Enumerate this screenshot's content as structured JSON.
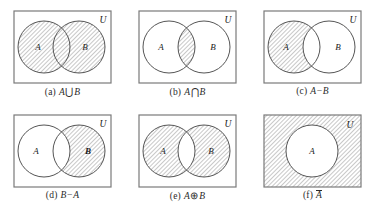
{
  "figure": {
    "universe_label": "U",
    "set_a_label": "A",
    "set_b_label": "B",
    "colors": {
      "border": "#7a7a7a",
      "circle_stroke": "#555555",
      "hatch_line": "#9a9a9a",
      "hatch_background": "#ffffff",
      "text": "#1a1a1a",
      "page_background": "#ffffff"
    },
    "panels": [
      {
        "key": "a",
        "caption_label": "(a)",
        "caption_lhs": "A",
        "caption_op": "⋃",
        "caption_rhs": "B",
        "caption_plain": "(a) A ⋃ B",
        "operation": "union",
        "shaded_regions": [
          "A only",
          "A and B",
          "B only"
        ],
        "circles": [
          "A",
          "B"
        ],
        "universe_shaded": false
      },
      {
        "key": "b",
        "caption_label": "(b)",
        "caption_lhs": "A",
        "caption_op": "⋂",
        "caption_rhs": "B",
        "caption_plain": "(b) A ⋂ B",
        "operation": "intersection",
        "shaded_regions": [
          "A and B"
        ],
        "circles": [
          "A",
          "B"
        ],
        "universe_shaded": false
      },
      {
        "key": "c",
        "caption_label": "(c)",
        "caption_lhs": "A",
        "caption_op": "−",
        "caption_rhs": "B",
        "caption_plain": "(c) A−B",
        "operation": "difference-a-minus-b",
        "shaded_regions": [
          "A only"
        ],
        "circles": [
          "A",
          "B"
        ],
        "universe_shaded": false
      },
      {
        "key": "d",
        "caption_label": "(d)",
        "caption_lhs": "B",
        "caption_op": "−",
        "caption_rhs": "A",
        "caption_plain": "(d) B−A",
        "operation": "difference-b-minus-a",
        "shaded_regions": [
          "B only"
        ],
        "circles": [
          "A",
          "B"
        ],
        "universe_shaded": false
      },
      {
        "key": "e",
        "caption_label": "(e)",
        "caption_lhs": "A",
        "caption_op": "⊕",
        "caption_rhs": "B",
        "caption_plain": "(e) A ⊕ B",
        "operation": "symmetric-difference",
        "shaded_regions": [
          "A only",
          "B only"
        ],
        "circles": [
          "A",
          "B"
        ],
        "universe_shaded": false
      },
      {
        "key": "f",
        "caption_label": "(f)",
        "caption_lhs": "A",
        "caption_op": "",
        "caption_rhs": "",
        "caption_plain": "(f) Ā",
        "operation": "complement",
        "shaded_regions": [
          "outside A"
        ],
        "circles": [
          "A"
        ],
        "universe_shaded": true
      }
    ]
  }
}
